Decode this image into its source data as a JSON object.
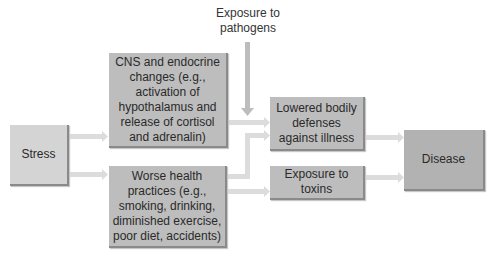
{
  "diagram": {
    "title": "",
    "nodes": {
      "stress": {
        "label": "Stress"
      },
      "cns": {
        "label": "CNS and endocrine changes (e.g., activation of hypothalamus and release of cortisol and adrenalin)"
      },
      "worse_health": {
        "label": "Worse health practices (e.g., smoking, drinking, diminished exercise, poor diet, accidents)"
      },
      "pathogens": {
        "label": "Exposure to pathogens"
      },
      "lowered_defenses": {
        "label": "Lowered bodily defenses against illness"
      },
      "toxins": {
        "label": "Exposure to toxins"
      },
      "disease": {
        "label": "Disease"
      }
    },
    "edges": [
      {
        "from": "stress",
        "to": "cns"
      },
      {
        "from": "stress",
        "to": "worse_health"
      },
      {
        "from": "pathogens",
        "to": "lowered_defenses"
      },
      {
        "from": "cns",
        "to": "lowered_defenses"
      },
      {
        "from": "worse_health",
        "to": "lowered_defenses"
      },
      {
        "from": "worse_health",
        "to": "toxins"
      },
      {
        "from": "lowered_defenses",
        "to": "disease"
      },
      {
        "from": "toxins",
        "to": "disease"
      }
    ],
    "colors": {
      "arrow": "#d9d9d9",
      "box_light": "#d4d4d4",
      "box_mid": "#bdbdbd",
      "box_dark": "#b2b2b2"
    }
  }
}
